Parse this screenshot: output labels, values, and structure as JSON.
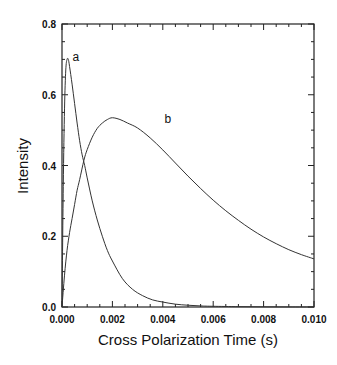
{
  "chart_data": {
    "type": "line",
    "title": "",
    "xlabel": "Cross Polarization Time (s)",
    "ylabel": "Intensity",
    "xlim": [
      0.0,
      0.01
    ],
    "ylim": [
      0.0,
      0.8
    ],
    "grid": false,
    "legend_position": "none",
    "x_ticks": [
      0.0,
      0.002,
      0.004,
      0.006,
      0.008,
      0.01
    ],
    "x_tick_labels": [
      "0.000",
      "0.002",
      "0.004",
      "0.006",
      "0.008",
      "0.010"
    ],
    "y_ticks": [
      0.0,
      0.2,
      0.4,
      0.6,
      0.8
    ],
    "y_tick_labels": [
      "0.0",
      "0.2",
      "0.4",
      "0.6",
      "0.8"
    ],
    "x_minor_step": 0.0005,
    "y_minor_step": 0.05,
    "series": [
      {
        "name": "a",
        "x": [
          0.0,
          5e-05,
          0.0001,
          0.00015,
          0.0002,
          0.00025,
          0.0003,
          0.0004,
          0.0005,
          0.0006,
          0.0007,
          0.0008,
          0.0009,
          0.001,
          0.0012,
          0.0014,
          0.0016,
          0.0018,
          0.002,
          0.0024,
          0.0028,
          0.0032,
          0.0036,
          0.004,
          0.0045,
          0.005,
          0.0055,
          0.006,
          0.007,
          0.008,
          0.009,
          0.01
        ],
        "y": [
          0.0,
          0.34,
          0.56,
          0.67,
          0.7,
          0.7,
          0.68,
          0.63,
          0.575,
          0.52,
          0.47,
          0.43,
          0.4,
          0.365,
          0.3,
          0.246,
          0.2,
          0.16,
          0.13,
          0.08,
          0.05,
          0.032,
          0.02,
          0.014,
          0.008,
          0.005,
          0.003,
          0.002,
          0.001,
          0.0005,
          0.0002,
          0.0001
        ]
      },
      {
        "name": "b",
        "x": [
          0.0,
          0.0001,
          0.0002,
          0.0003,
          0.0004,
          0.0005,
          0.0006,
          0.0007,
          0.00087,
          0.001,
          0.0012,
          0.0014,
          0.0016,
          0.0018,
          0.002,
          0.0023,
          0.0026,
          0.003,
          0.0035,
          0.004,
          0.0045,
          0.005,
          0.0055,
          0.006,
          0.0065,
          0.007,
          0.0075,
          0.008,
          0.0085,
          0.009,
          0.0095,
          0.01
        ],
        "y": [
          0.0,
          0.09,
          0.16,
          0.21,
          0.25,
          0.29,
          0.33,
          0.36,
          0.415,
          0.445,
          0.48,
          0.505,
          0.52,
          0.53,
          0.535,
          0.53,
          0.52,
          0.506,
          0.478,
          0.444,
          0.407,
          0.37,
          0.335,
          0.302,
          0.272,
          0.245,
          0.22,
          0.198,
          0.179,
          0.162,
          0.148,
          0.136
        ]
      }
    ],
    "annotations": [
      {
        "text": "a",
        "x": 0.00055,
        "y": 0.695
      },
      {
        "text": "b",
        "x": 0.0042,
        "y": 0.52
      }
    ]
  },
  "colors": {
    "background": "#ffffff",
    "axis": "#222222",
    "line": "#333333",
    "text": "#111111"
  }
}
